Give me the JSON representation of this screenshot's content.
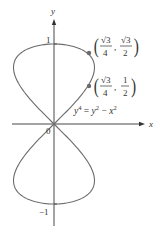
{
  "figure": {
    "equation": "y^4 = y^2 - x^2",
    "equation_parts": {
      "lhs_base": "y",
      "lhs_exp": "4",
      "eq": " = ",
      "t1_base": "y",
      "t1_exp": "2",
      "minus": " − ",
      "t2_base": "x",
      "t2_exp": "2"
    },
    "axes": {
      "x_label": "x",
      "y_label": "y",
      "origin_label": "0",
      "y_ticks": [
        {
          "value": 1,
          "label": "1"
        },
        {
          "value": -1,
          "label": "−1"
        }
      ]
    },
    "points": [
      {
        "name": "upper-point",
        "x": 0.433,
        "y": 0.866,
        "num_x": "√3",
        "den_x": "4",
        "num_y": "√3",
        "den_y": "2"
      },
      {
        "name": "lower-point",
        "x": 0.433,
        "y": 0.5,
        "num_x": "√3",
        "den_x": "4",
        "num_y": "1",
        "den_y": "2"
      }
    ],
    "colors": {
      "curve": "#6b6b6b",
      "axis": "#333333",
      "point": "#6b6b6b",
      "text": "#333333"
    },
    "layout": {
      "origin_px": [
        54,
        124
      ],
      "scale_x": 81,
      "scale_y": 80
    }
  },
  "chart_data": {
    "type": "line",
    "title": "",
    "xlabel": "x",
    "ylabel": "y",
    "equation": "y^4 = y^2 - x^2",
    "xlim": [
      -0.52,
      1.1
    ],
    "ylim": [
      -1.05,
      1.3
    ],
    "curve": "x = ±sqrt(y^2 - y^4), figure-eight (lemniscate-like) curve through origin, extreme x = ±0.5 at y = ±1/√2, extreme y = ±1 at x = 0",
    "marked_points": [
      [
        0.433,
        0.866
      ],
      [
        0.433,
        0.5
      ]
    ],
    "tick_labels": {
      "y": [
        "1",
        "−1"
      ],
      "origin": "0"
    }
  }
}
